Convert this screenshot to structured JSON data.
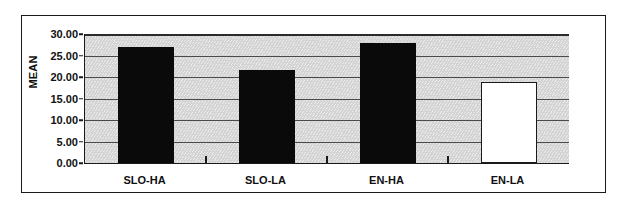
{
  "chart_data": {
    "type": "bar",
    "title": "",
    "subtitle": "",
    "xlabel": "",
    "ylabel": "MEAN",
    "categories": [
      "SLO-HA",
      "SLO-LA",
      "EN-HA",
      "EN-LA"
    ],
    "values": [
      27.0,
      21.7,
      28.0,
      18.8
    ],
    "series": [
      {
        "name": "MEAN",
        "values": [
          27.0,
          21.7,
          28.0,
          18.8
        ]
      }
    ],
    "bar_styles": [
      "filled-black",
      "filled-black",
      "filled-black",
      "open-white"
    ],
    "ylim": [
      0.0,
      30.0
    ],
    "ytick_step": 5.0,
    "ytick_labels": [
      "30.00",
      "25.00",
      "20.00",
      "15.00",
      "10.00",
      "5.00",
      "0.00"
    ],
    "ytick_values": [
      30.0,
      25.0,
      20.0,
      15.0,
      10.0,
      5.0,
      0.0
    ],
    "grid": true,
    "grid_axis": "y",
    "legend": false,
    "legend_position": "none",
    "plot_background_color": "#d4d4d4",
    "bar_fill_color": "#0a0a0a",
    "bar_open_fill_color": "#ffffff",
    "bar_border_color": "#1a1a1a",
    "axis_color": "#1a1a1a",
    "gridline_color": "#4a4a4a",
    "figure_background_color": "#ffffff",
    "annotations": []
  },
  "axis": {
    "y_title": "MEAN"
  }
}
